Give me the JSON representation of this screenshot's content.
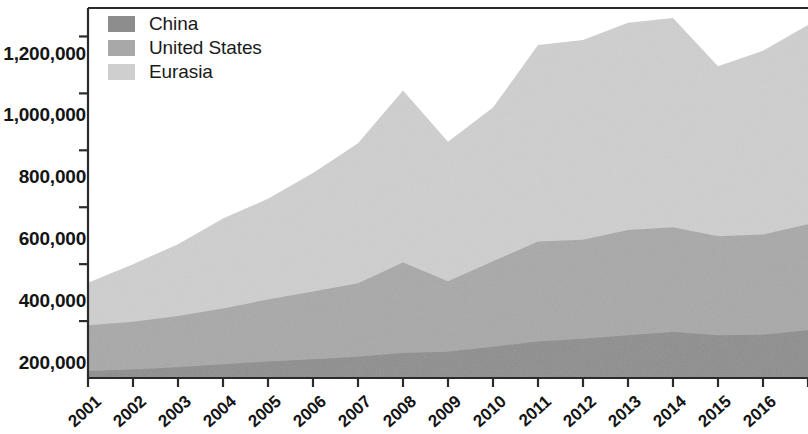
{
  "chart_data": {
    "type": "area",
    "stacked": true,
    "title": "",
    "subtitle": "",
    "xlabel": "",
    "ylabel": "",
    "grid": false,
    "legend_position": "top-left",
    "x": [
      2001,
      2002,
      2003,
      2004,
      2005,
      2006,
      2007,
      2008,
      2009,
      2010,
      2011,
      2012,
      2013,
      2014,
      2015,
      2016,
      2017
    ],
    "categories": [
      "2001",
      "2002",
      "2003",
      "2004",
      "2005",
      "2006",
      "2007",
      "2008",
      "2009",
      "2010",
      "2011",
      "2012",
      "2013",
      "2014",
      "2015",
      "2016",
      ""
    ],
    "xtick_labels": [
      "2001",
      "2002",
      "2003",
      "2004",
      "2005",
      "2006",
      "2007",
      "2008",
      "2009",
      "2010",
      "2011",
      "2012",
      "2013",
      "2014",
      "2015",
      "2016"
    ],
    "ytick_labels": [
      "200,000",
      "400,000",
      "600,000",
      "800,000",
      "1,000,000",
      "1,200,000"
    ],
    "ytick_values": [
      200000,
      400000,
      600000,
      800000,
      1000000,
      1200000
    ],
    "ylim": [
      0,
      1300000
    ],
    "xlim": [
      2001,
      2017
    ],
    "series": [
      {
        "name": "China",
        "color": "#8d8d8d",
        "values": [
          25000,
          30000,
          38000,
          48000,
          58000,
          66000,
          75000,
          88000,
          92000,
          110000,
          128000,
          138000,
          150000,
          162000,
          150000,
          152000,
          168000
        ]
      },
      {
        "name": "United States",
        "color": "#a8a8a8",
        "values": [
          160000,
          168000,
          180000,
          196000,
          218000,
          238000,
          258000,
          318000,
          248000,
          300000,
          352000,
          348000,
          370000,
          368000,
          348000,
          352000,
          372000
        ]
      },
      {
        "name": "Eurasia",
        "color": "#cfcfcf",
        "values": [
          150000,
          202000,
          252000,
          316000,
          354000,
          416000,
          492000,
          604000,
          490000,
          540000,
          690000,
          702000,
          728000,
          735000,
          597000,
          646000,
          700000
        ]
      }
    ],
    "totals": [
      335000,
      400000,
      470000,
      560000,
      630000,
      720000,
      825000,
      1010000,
      830000,
      950000,
      1170000,
      1188000,
      1248000,
      1265000,
      1095000,
      1150000,
      1240000
    ]
  },
  "legend": {
    "items": [
      {
        "label": "China",
        "color": "#8d8d8d"
      },
      {
        "label": "United States",
        "color": "#a8a8a8"
      },
      {
        "label": "Eurasia",
        "color": "#cfcfcf"
      }
    ]
  },
  "axes": {
    "y_labels": [
      "1,200,000",
      "1,000,000",
      "800,000",
      "600,000",
      "400,000",
      "200,000"
    ],
    "x_labels": [
      "2001",
      "2002",
      "2003",
      "2004",
      "2005",
      "2006",
      "2007",
      "2008",
      "2009",
      "2010",
      "2011",
      "2012",
      "2013",
      "2014",
      "2015",
      "2016"
    ]
  },
  "colors": {
    "china": "#8d8d8d",
    "united_states": "#a8a8a8",
    "eurasia": "#cfcfcf",
    "axis": "#2b2b2b",
    "background": "#ffffff"
  }
}
